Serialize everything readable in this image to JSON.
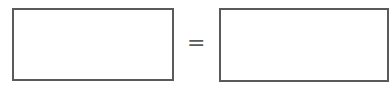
{
  "equation": {
    "left_value": "",
    "operator": "=",
    "right_value": ""
  },
  "colors": {
    "border": "#5a5a5a",
    "background": "#ffffff"
  }
}
